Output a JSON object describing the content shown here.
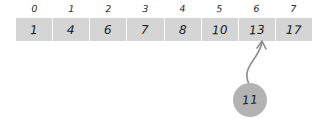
{
  "diagram": {
    "background_color": "#ffffff",
    "array": {
      "name": "sorted-array",
      "cell_color": "#d5d5d5",
      "indices": [
        "0",
        "1",
        "2",
        "3",
        "4",
        "5",
        "6",
        "7"
      ],
      "values": [
        "1",
        "4",
        "6",
        "7",
        "8",
        "10",
        "13",
        "17"
      ]
    },
    "insert": {
      "name": "value-to-insert",
      "value": "11",
      "bubble_color": "#b3b3b3",
      "target_index": "6",
      "arrow_color": "#808080"
    }
  }
}
